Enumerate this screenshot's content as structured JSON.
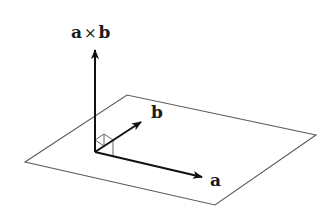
{
  "diagram": {
    "type": "vector cross product illustration",
    "labels": {
      "cross_left": "a",
      "cross_op": "×",
      "cross_right": "b",
      "vector_b": "b",
      "vector_a": "a"
    },
    "plane": {
      "corners": [
        [
          25,
          162
        ],
        [
          127,
          95
        ],
        [
          316,
          135
        ],
        [
          215,
          205
        ]
      ],
      "stroke": "#555555"
    },
    "vectors": [
      {
        "name": "a×b",
        "from": [
          95,
          152
        ],
        "to": [
          95,
          48
        ],
        "color": "#111111"
      },
      {
        "name": "b",
        "from": [
          95,
          152
        ],
        "to": [
          141,
          122
        ],
        "color": "#111111"
      },
      {
        "name": "a",
        "from": [
          95,
          152
        ],
        "to": [
          203,
          178
        ],
        "color": "#111111"
      }
    ],
    "right_angle_marker": true
  }
}
